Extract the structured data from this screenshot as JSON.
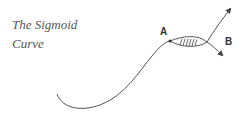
{
  "title": {
    "line1": "The Sigmoid",
    "line2": "Curve"
  },
  "labels": {
    "a": "A",
    "b": "B"
  },
  "colors": {
    "curve": "#555555",
    "text": "#555555",
    "label": "#333333"
  }
}
